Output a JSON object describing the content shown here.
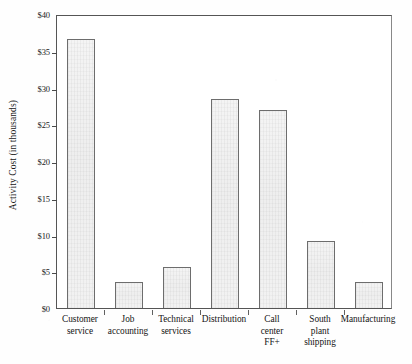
{
  "chart_data": {
    "type": "bar",
    "title": "",
    "xlabel": "",
    "ylabel": "Activity Cost (in thousands)",
    "ylim": [
      0,
      40
    ],
    "ytick_step": 5,
    "grid": false,
    "legend": null,
    "currency_prefix": "$",
    "units": "thousands of dollars",
    "categories": [
      "Customer service",
      "Job accounting",
      "Technical services",
      "Distribution",
      "Call center FF+",
      "South plant shipping",
      "Manufacturing"
    ],
    "category_lines": [
      [
        "Customer",
        "service"
      ],
      [
        "Job",
        "accounting"
      ],
      [
        "Technical",
        "services"
      ],
      [
        "Distribution"
      ],
      [
        "Call",
        "center",
        "FF+"
      ],
      [
        "South",
        "plant",
        "shipping"
      ],
      [
        "Manufacturing"
      ]
    ],
    "values": [
      36.6,
      3.6,
      5.6,
      28.4,
      27.0,
      9.1,
      3.5
    ],
    "ytick_labels": [
      "$0",
      "$5",
      "$10",
      "$15",
      "$20",
      "$25",
      "$30",
      "$35",
      "$40"
    ],
    "ytick_values": [
      0,
      5,
      10,
      15,
      20,
      25,
      30,
      35,
      40
    ],
    "bar_fill_color": "#f0f0f0",
    "bar_border_color": "#6d6d6d",
    "axis_color": "#555555",
    "background_color": "#ffffff"
  }
}
